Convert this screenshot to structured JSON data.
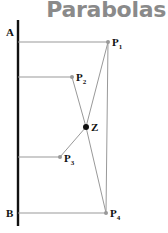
{
  "title": {
    "text": "Parabolas",
    "color": "#8a8a8a"
  },
  "diagram": {
    "axis": {
      "x": 18,
      "y1": 20,
      "y2": 226,
      "color": "#111111"
    },
    "line_color": "#999999",
    "labels": {
      "A": "A",
      "B": "B",
      "P1": "P",
      "P1_sub": "1",
      "P2": "P",
      "P2_sub": "2",
      "P3": "P",
      "P3_sub": "3",
      "P4": "P",
      "P4_sub": "4",
      "Z": "Z"
    },
    "points": {
      "A": [
        18,
        42
      ],
      "B": [
        18,
        213
      ],
      "P1": [
        108,
        42
      ],
      "P2": [
        72,
        77
      ],
      "Z": [
        86,
        127
      ],
      "P3": [
        60,
        157
      ],
      "P4": [
        106,
        213
      ]
    }
  }
}
